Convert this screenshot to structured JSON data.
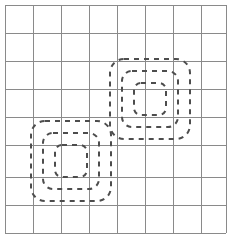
{
  "figure": {
    "title": "",
    "width": 227,
    "height": 234,
    "background_color": "#ffffff",
    "grid": {
      "label": "background-grid",
      "columns": 8,
      "rows": 8,
      "cell_size": 28,
      "origin_x": 5,
      "origin_y": 5,
      "line_color": "#8a8a8a",
      "line_width": 1,
      "x_lines": [
        5,
        33,
        61,
        89,
        117,
        145,
        173,
        201,
        226
      ],
      "y_lines": [
        5,
        33,
        61,
        89,
        117,
        145,
        177,
        205,
        233
      ]
    },
    "shapes": [
      {
        "id": "cluster-upper-right",
        "label": "dashed-cluster-upper-right",
        "center_x": 150,
        "center_y": 99,
        "size": 80,
        "stroke_color": "#4d4d4d",
        "stroke_width": 2,
        "dash_pattern": "5 5",
        "rings": [
          {
            "radius": 40,
            "corner_radius": 14
          },
          {
            "radius": 28,
            "corner_radius": 10
          },
          {
            "radius": 16,
            "corner_radius": 7
          }
        ]
      },
      {
        "id": "cluster-lower-left",
        "label": "dashed-cluster-lower-left",
        "center_x": 71,
        "center_y": 161,
        "size": 80,
        "stroke_color": "#4d4d4d",
        "stroke_width": 2,
        "dash_pattern": "5 5",
        "rings": [
          {
            "radius": 40,
            "corner_radius": 14
          },
          {
            "radius": 28,
            "corner_radius": 10
          },
          {
            "radius": 16,
            "corner_radius": 7
          }
        ]
      }
    ],
    "colors": {
      "grid_line": "#8a8a8a",
      "shape_stroke": "#4d4d4d",
      "background": "#ffffff"
    }
  },
  "chart_data": {
    "type": "scatter",
    "title": "",
    "subtitle": "",
    "xlabel": "",
    "ylabel": "",
    "xlim": [
      0,
      8
    ],
    "ylim": [
      0,
      8
    ],
    "grid": true,
    "legend": "none",
    "tick_labels_x": [],
    "tick_labels_y": [],
    "annotations": [],
    "series": [
      {
        "name": "cluster",
        "marker": "dashed-concentric-squares",
        "points": [
          {
            "x": 5.18,
            "y": 4.64
          },
          {
            "x": 2.36,
            "y": 2.43
          }
        ]
      }
    ]
  }
}
